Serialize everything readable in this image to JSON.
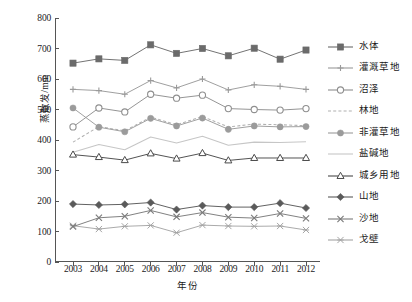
{
  "chart_data": {
    "type": "line",
    "title": "",
    "xlabel": "年份",
    "ylabel": "蒸散发/mm",
    "x": [
      2003,
      2004,
      2005,
      2006,
      2007,
      2008,
      2009,
      2010,
      2011,
      2012
    ],
    "xtick_labels": [
      "2003",
      "2004",
      "2005",
      "2006",
      "2007",
      "2008",
      "2009",
      "2010",
      "2011",
      "2012"
    ],
    "ytick_labels": [
      "0",
      "100",
      "200",
      "300",
      "400",
      "500",
      "600",
      "700",
      "800"
    ],
    "ylim": [
      0,
      800
    ],
    "ytick_step": 100,
    "grid": false,
    "legend_position": "right",
    "series": [
      {
        "name": "水体",
        "marker": "filled-square",
        "line": "solid",
        "color": "#6b6b6b",
        "values": [
          652,
          666,
          661,
          712,
          684,
          700,
          676,
          701,
          665,
          695
        ]
      },
      {
        "name": "灌溉草地",
        "marker": "plus",
        "line": "solid",
        "color": "#9a9a9a",
        "values": [
          566,
          562,
          550,
          595,
          571,
          600,
          564,
          581,
          576,
          566
        ]
      },
      {
        "name": "沼泽",
        "marker": "open-circle",
        "line": "solid",
        "color": "#8f8f8f",
        "values": [
          443,
          505,
          492,
          550,
          537,
          547,
          503,
          500,
          498,
          503
        ]
      },
      {
        "name": "林地",
        "marker": "none",
        "line": "dashed",
        "color": "#b0b0b0",
        "values": [
          393,
          444,
          430,
          475,
          450,
          477,
          443,
          452,
          450,
          447
        ]
      },
      {
        "name": "非灌草地",
        "marker": "filled-circle",
        "line": "solid",
        "color": "#9b9b9b",
        "values": [
          505,
          442,
          427,
          471,
          446,
          472,
          435,
          446,
          443,
          444
        ]
      },
      {
        "name": "盐碱地",
        "marker": "none",
        "line": "solid",
        "color": "#c6c6c6",
        "values": [
          360,
          385,
          368,
          410,
          390,
          412,
          383,
          393,
          392,
          394
        ]
      },
      {
        "name": "城乡用地",
        "marker": "open-triangle",
        "line": "solid",
        "color": "#4a4a4a",
        "values": [
          352,
          344,
          334,
          356,
          339,
          357,
          333,
          341,
          341,
          341
        ]
      },
      {
        "name": "山地",
        "marker": "filled-diamond",
        "line": "solid",
        "color": "#5a5a5a",
        "values": [
          190,
          187,
          189,
          195,
          172,
          185,
          180,
          180,
          193,
          177
        ]
      },
      {
        "name": "沙地",
        "marker": "cross-x",
        "line": "solid",
        "color": "#7a7a7a",
        "values": [
          116,
          145,
          150,
          169,
          148,
          162,
          147,
          144,
          159,
          143
        ]
      },
      {
        "name": "戈壁",
        "marker": "cross-small",
        "line": "solid",
        "color": "#a5a5a5",
        "values": [
          119,
          108,
          117,
          120,
          96,
          121,
          118,
          117,
          118,
          105
        ]
      }
    ]
  },
  "legend": {
    "items": [
      {
        "label": "水体"
      },
      {
        "label": "灌溉草地"
      },
      {
        "label": "沼泽"
      },
      {
        "label": "林地"
      },
      {
        "label": "非灌草地"
      },
      {
        "label": "盐碱地"
      },
      {
        "label": "城乡用地"
      },
      {
        "label": "山地"
      },
      {
        "label": "沙地"
      },
      {
        "label": "戈壁"
      }
    ]
  }
}
